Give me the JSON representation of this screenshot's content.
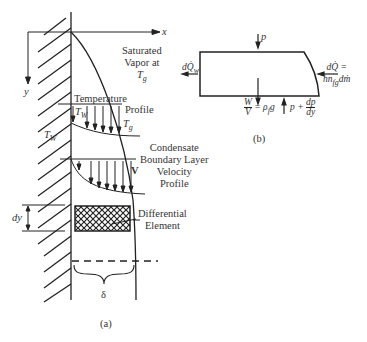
{
  "panel_a": {
    "caption": "(a)",
    "axis_x": "x",
    "axis_y": "y",
    "vapor_label": [
      "Saturated",
      "Vapor at"
    ],
    "vapor_temp": "T",
    "vapor_temp_sub": "g",
    "temp_profile_label": [
      "Temperature",
      "Profile"
    ],
    "tw_label": "T",
    "tw_sub": "W",
    "tg_label": "T",
    "tg_sub": "g",
    "wall_temp_label": "T",
    "wall_temp_sub": "W",
    "velocity_label": [
      "Condensate",
      "Boundary Layer",
      "Velocity",
      "Profile"
    ],
    "velocity_symbol": "V",
    "dy_label": "dy",
    "element_label": [
      "Differential",
      "Element"
    ],
    "delta_label": "δ"
  },
  "panel_b": {
    "caption": "(b)",
    "top_force": "p",
    "heat_out": "dQ̇",
    "heat_out_sub": "w",
    "heat_in": [
      "dQ̇ =",
      "hn"
    ],
    "heat_in_sub": "fg",
    "heat_in_tail": "dṁ",
    "weight_num": "W",
    "weight_den": "V",
    "weight_rhs": "= ρ",
    "weight_rhs_sub": "f",
    "weight_g": "g",
    "bottom_force": "p +",
    "dp_num": "dp",
    "dp_den": "dy"
  }
}
